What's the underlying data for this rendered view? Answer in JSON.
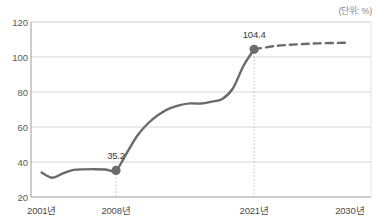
{
  "unit_note": "(단위: %)",
  "chart_data": {
    "type": "line",
    "title": "",
    "subtitle": "",
    "xlabel": "",
    "ylabel": "",
    "unit": "(단위: %)",
    "ylim": [
      20,
      120
    ],
    "yticks": [
      20,
      40,
      60,
      80,
      100,
      120
    ],
    "ytick_labels": [
      "20",
      "40",
      "60",
      "80",
      "100",
      "120"
    ],
    "grid": true,
    "legend": "none",
    "xlim": [
      2000,
      2032
    ],
    "xticks": [
      2001,
      2008,
      2021,
      2030
    ],
    "xtick_labels": [
      "2001년",
      "2008년",
      "2021년",
      "2030년"
    ],
    "series": [
      {
        "name": "실적",
        "style": "solid",
        "color": "#6b6b6b",
        "x": [
          2001,
          2002,
          2003,
          2004,
          2005,
          2006,
          2007,
          2008,
          2009,
          2010,
          2011,
          2012,
          2013,
          2014,
          2015,
          2016,
          2017,
          2018,
          2019,
          2020,
          2021
        ],
        "values": [
          34.0,
          31.0,
          33.5,
          35.5,
          35.8,
          35.9,
          35.7,
          35.2,
          45.0,
          55.0,
          62.0,
          67.0,
          70.5,
          72.5,
          73.5,
          73.4,
          74.5,
          76.0,
          82.0,
          95.0,
          104.4
        ]
      },
      {
        "name": "전망",
        "style": "dashed",
        "color": "#6b6b6b",
        "x": [
          2021,
          2023,
          2025,
          2027,
          2030
        ],
        "values": [
          104.4,
          106.3,
          107.2,
          107.8,
          108.2
        ]
      }
    ],
    "annotations": [
      {
        "x": 2008,
        "y": 35.2,
        "label": "35.2",
        "marker": true,
        "vline": true
      },
      {
        "x": 2021,
        "y": 104.4,
        "label": "104.4",
        "marker": true,
        "vline": true
      }
    ]
  }
}
